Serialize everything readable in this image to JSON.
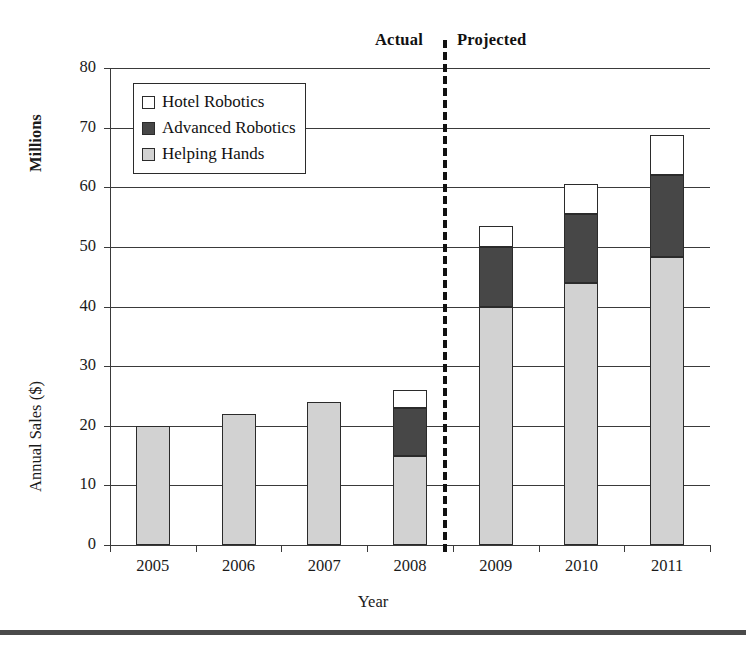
{
  "chart_data": {
    "type": "bar",
    "subtype": "stacked-bar",
    "title": "",
    "xlabel": "Year",
    "ylabel": "Annual Sales ($)",
    "y_unit_label": "Millions",
    "categories": [
      "2005",
      "2006",
      "2007",
      "2008",
      "2009",
      "2010",
      "2011"
    ],
    "series": [
      {
        "name": "Helping Hands",
        "color": "#d2d2d2",
        "values": [
          20,
          22,
          24,
          15,
          40,
          44,
          48.3
        ]
      },
      {
        "name": "Advanced Robotics",
        "color": "#474747",
        "values": [
          0,
          0,
          0,
          8,
          10,
          11.5,
          13.7
        ]
      },
      {
        "name": "Hotel Robotics",
        "color": "#ffffff",
        "values": [
          0,
          0,
          0,
          3,
          3.5,
          5,
          6.7
        ]
      }
    ],
    "totals": [
      20,
      22,
      24,
      26,
      53.5,
      60.5,
      68.7
    ],
    "ylim": [
      0,
      80
    ],
    "ytick_values": [
      0,
      10,
      20,
      30,
      40,
      50,
      60,
      70,
      80
    ],
    "ytick_labels": [
      "0",
      "10",
      "20",
      "30",
      "40",
      "50",
      "60",
      "70",
      "80"
    ],
    "grid": true,
    "grid_axis": "y",
    "legend_position": "upper-left-inside",
    "annotations": [
      {
        "name": "actual-label",
        "text": "Actual"
      },
      {
        "name": "projected-label",
        "text": "Projected"
      },
      {
        "name": "phase-divider",
        "text": "",
        "style": "dashed-vertical",
        "between": [
          "2008",
          "2009"
        ]
      }
    ]
  },
  "legend": {
    "items": [
      {
        "label": "Hotel Robotics",
        "color": "#ffffff"
      },
      {
        "label": "Advanced Robotics",
        "color": "#474747"
      },
      {
        "label": "Helping Hands",
        "color": "#d2d2d2"
      }
    ]
  },
  "annotations": {
    "actual": "Actual",
    "projected": "Projected"
  },
  "axes": {
    "x_title": "Year",
    "y_title": "Annual Sales ($)",
    "y_unit": "Millions"
  },
  "colors": {
    "hotel_robotics": "#ffffff",
    "advanced_robotics": "#474747",
    "helping_hands": "#d2d2d2",
    "outline": "#2b2b2b",
    "grid": "#3a3a3a",
    "footer_rule": "#4a4a4a"
  }
}
